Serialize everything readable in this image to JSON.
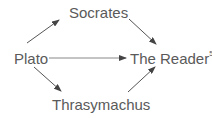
{
  "diagram": {
    "nodes": [
      {
        "id": "socrates",
        "label": "Socrates"
      },
      {
        "id": "plato",
        "label": "Plato"
      },
      {
        "id": "reader",
        "label": "The Reader",
        "superscript": "5"
      },
      {
        "id": "thrasymachus",
        "label": "Thrasymachus"
      }
    ],
    "edges": [
      {
        "from": "plato",
        "to": "socrates"
      },
      {
        "from": "socrates",
        "to": "reader"
      },
      {
        "from": "plato",
        "to": "reader"
      },
      {
        "from": "plato",
        "to": "thrasymachus"
      },
      {
        "from": "thrasymachus",
        "to": "reader"
      }
    ],
    "colors": {
      "text": "#5a5a5a",
      "arrow": "#444444"
    }
  }
}
